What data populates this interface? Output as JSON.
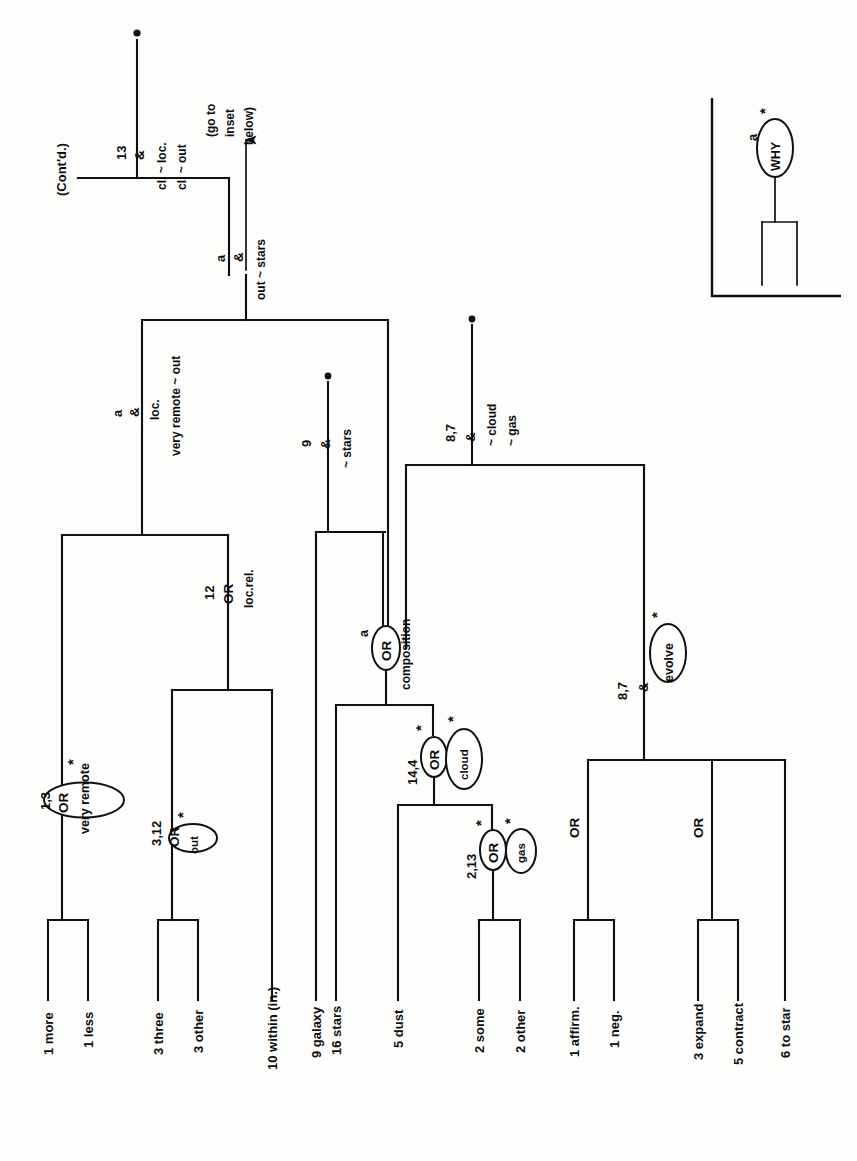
{
  "page": {
    "orientation": "rotated-90-ccw",
    "background_color": "#fdfdfc",
    "ink_color": "#101010"
  },
  "diagram": {
    "continuation_label": "(Cont'd.)",
    "inset_pointer": {
      "line1": "(go to",
      "line2": "inset",
      "line3": "below)"
    },
    "nodes": [
      {
        "id": "n13",
        "rank": "13",
        "operator": "&",
        "premise_line1": "cl. ~ loc.",
        "premise_line2": "cl. ~ out",
        "terminator": "dot"
      },
      {
        "id": "n_a_out_stars",
        "rank": "a",
        "operator": "&",
        "premise_line1": "out ~ stars"
      },
      {
        "id": "n_a_loc",
        "rank": "a",
        "operator": "&",
        "premise_line1": "loc.",
        "premise_line2": "very remote ~ out"
      },
      {
        "id": "n12",
        "rank": "12",
        "operator": "OR",
        "premise_line1": "loc.rel."
      },
      {
        "id": "n13_or",
        "rank": "1,3",
        "operator": "OR",
        "ellipse": "very remote",
        "ellipse_star": "*"
      },
      {
        "id": "n312_or",
        "rank": "3,12",
        "operator": "OR",
        "ellipse": "out",
        "ellipse_star": "*"
      },
      {
        "id": "n9",
        "rank": "9",
        "operator": "&",
        "premise_line1": "~ stars",
        "terminator": "dot"
      },
      {
        "id": "n_a_comp",
        "rank": "a",
        "operator": "OR",
        "operator_in_ellipse": true,
        "premise_line1": "composition"
      },
      {
        "id": "n144",
        "rank": "14,4",
        "operator": "OR",
        "operator_in_ellipse": true,
        "operator_star": "*",
        "ellipse": "cloud",
        "ellipse_star": "*"
      },
      {
        "id": "n213",
        "rank": "2,13",
        "operator": "OR",
        "operator_in_ellipse": true,
        "operator_star": "*",
        "ellipse": "gas",
        "ellipse_star": "*"
      },
      {
        "id": "n87_cloudgas",
        "rank": "8,7",
        "operator": "&",
        "premise_line1": "~ cloud",
        "premise_line2": "~ gas",
        "terminator": "dot"
      },
      {
        "id": "n87_evolve",
        "rank": "8,7",
        "operator": "&",
        "ellipse": "evolve",
        "ellipse_star": "*"
      },
      {
        "id": "n_or_affirm",
        "rank": "",
        "operator": "OR"
      },
      {
        "id": "n_or_expand",
        "rank": "",
        "operator": "OR"
      }
    ],
    "leaves": [
      {
        "id": "l1",
        "count": "1",
        "text": "more"
      },
      {
        "id": "l2",
        "count": "1",
        "text": "less"
      },
      {
        "id": "l3",
        "count": "3",
        "text": "three"
      },
      {
        "id": "l4",
        "count": "3",
        "text": "other"
      },
      {
        "id": "l5",
        "count": "10",
        "text": "within (in.)"
      },
      {
        "id": "l6",
        "count": "9",
        "text": "galaxy"
      },
      {
        "id": "l7",
        "count": "16",
        "text": "stars"
      },
      {
        "id": "l8",
        "count": "5",
        "text": "dust"
      },
      {
        "id": "l9",
        "count": "2",
        "text": "some"
      },
      {
        "id": "l10",
        "count": "2",
        "text": "other"
      },
      {
        "id": "l11",
        "count": "1",
        "text": "affirm."
      },
      {
        "id": "l12",
        "count": "1",
        "text": "neg."
      },
      {
        "id": "l13",
        "count": "3",
        "text": "expand"
      },
      {
        "id": "l14",
        "count": "5",
        "text": "contract"
      },
      {
        "id": "l15",
        "count": "6",
        "text": "to star"
      }
    ],
    "inset": {
      "node_rank": "a",
      "node_label": "WHY",
      "node_star": "*"
    }
  }
}
